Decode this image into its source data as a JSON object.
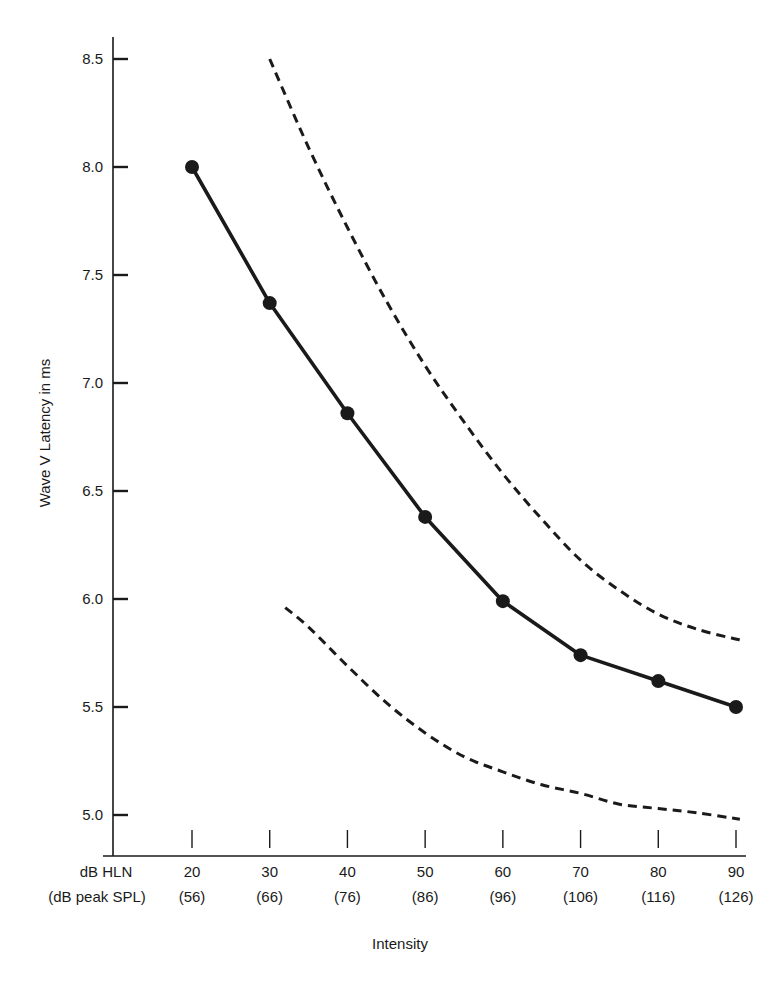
{
  "chart_data": {
    "type": "line",
    "title": "",
    "xlabel": "Intensity",
    "ylabel": "Wave V Latency in ms",
    "x_row_labels": [
      "dB HLN",
      "(dB peak SPL)"
    ],
    "x": [
      20,
      30,
      40,
      50,
      60,
      70,
      80,
      90
    ],
    "x_tick_labels": [
      "20",
      "30",
      "40",
      "50",
      "60",
      "70",
      "80",
      "90"
    ],
    "x_tick_sublabels": [
      "(56)",
      "(66)",
      "(76)",
      "(86)",
      "(96)",
      "(106)",
      "(116)",
      "(126)"
    ],
    "y_ticks": [
      5.0,
      5.5,
      6.0,
      6.5,
      7.0,
      7.5,
      8.0,
      8.5
    ],
    "y_tick_labels": [
      "5.0",
      "5.5",
      "6.0",
      "6.5",
      "7.0",
      "7.5",
      "8.0",
      "8.5"
    ],
    "ylim": [
      4.85,
      8.6
    ],
    "xlim": [
      17.5,
      90.5
    ],
    "grid": false,
    "legend": null,
    "series": [
      {
        "name": "Mean latency",
        "style": "solid-with-markers",
        "x": [
          20,
          30,
          40,
          50,
          60,
          70,
          80,
          90
        ],
        "values": [
          8.0,
          7.37,
          6.86,
          6.38,
          5.99,
          5.74,
          5.62,
          5.5
        ]
      },
      {
        "name": "Upper limit",
        "style": "dashed",
        "x": [
          30,
          35,
          40,
          45,
          50,
          55,
          60,
          65,
          70,
          75,
          80,
          85,
          90.5
        ],
        "values": [
          8.5,
          8.09,
          7.72,
          7.38,
          7.08,
          6.82,
          6.58,
          6.37,
          6.18,
          6.04,
          5.93,
          5.86,
          5.81
        ]
      },
      {
        "name": "Lower limit",
        "style": "dashed",
        "x": [
          32,
          35,
          40,
          45,
          50,
          55,
          60,
          65,
          70,
          75,
          80,
          85,
          90.5
        ],
        "values": [
          5.96,
          5.87,
          5.69,
          5.52,
          5.38,
          5.27,
          5.2,
          5.14,
          5.1,
          5.05,
          5.03,
          5.01,
          4.98
        ]
      }
    ]
  },
  "colors": {
    "ink": "#1a1a1a",
    "background": "#ffffff"
  }
}
